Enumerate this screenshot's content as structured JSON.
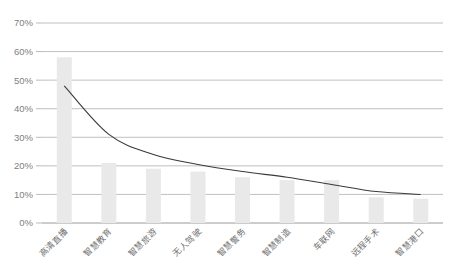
{
  "chart_data": {
    "type": "bar",
    "title": "",
    "subtitle": "",
    "xlabel": "",
    "ylabel": "",
    "ylim": [
      0,
      70
    ],
    "ytick_labels": [
      "0%",
      "10%",
      "20%",
      "30%",
      "40%",
      "50%",
      "60%",
      "70%"
    ],
    "ytick_values": [
      0,
      10,
      20,
      30,
      40,
      50,
      60,
      70
    ],
    "grid": true,
    "legend": "none",
    "categories": [
      "高清直播",
      "智慧教育",
      "智慧旅游",
      "无人驾驶",
      "智慧警务",
      "智慧制造",
      "车联网",
      "远程手术",
      "智慧港口"
    ],
    "series": [
      {
        "name": "占比",
        "type": "bar",
        "values": [
          58,
          21,
          19,
          18,
          16,
          15,
          15,
          9,
          8.5
        ]
      },
      {
        "name": "趋势线",
        "type": "line",
        "values": [
          48,
          31,
          24,
          20.5,
          18,
          16,
          13.5,
          11,
          10
        ]
      }
    ]
  },
  "style": {
    "bar_color": "#e9e9e9",
    "line_color": "#3a3a3a",
    "grid_color": "#b0b0b0",
    "axis_color": "#9a9a9a",
    "tick_text_color": "#808080",
    "category_text_color": "#6e6e6e",
    "background": "#ffffff"
  }
}
